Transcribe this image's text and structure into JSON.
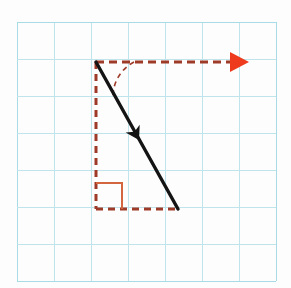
{
  "figure": {
    "caption": "A black vector arrow directed down and to the right, decomposed into dashed vertical and horizontal component legs, with a right-angle marker and an angle arc measured from the horizontal reference direction.",
    "canvas": {
      "width": 291,
      "height": 288,
      "background_color": "#fdfdfd"
    },
    "grid": {
      "name": "graph-paper-grid",
      "line_color": "#bfe4ec",
      "border_color": "#a9dbe6",
      "cell_size": 37,
      "origin_x": 17,
      "origin_y": 22,
      "columns": 7,
      "rows": 7,
      "line_width": 1
    },
    "elements": {
      "vector": {
        "name": "black-vector-arrow",
        "color": "#141414",
        "stroke_width": 3.4,
        "start_x": 96,
        "start_y": 62,
        "end_x": 178,
        "end_y": 209,
        "arrow_position_x": 139,
        "arrow_position_y": 140,
        "arrow_size": 13,
        "label": ""
      },
      "vertical_leg": {
        "name": "vertical-component-dashed-line",
        "color": "#9e3a28",
        "stroke_width": 3,
        "dash": "7,5",
        "x1": 96,
        "y1": 62,
        "x2": 96,
        "y2": 209,
        "label": ""
      },
      "horizontal_leg": {
        "name": "horizontal-component-dashed-line",
        "color": "#9e3a28",
        "stroke_width": 3,
        "dash": "7,5",
        "x1": 96,
        "y1": 209,
        "x2": 178,
        "y2": 209,
        "label": ""
      },
      "reference_line": {
        "name": "horizontal-reference-dashed-line",
        "color": "#9e3a28",
        "stroke_width": 3,
        "dash": "8,5",
        "x1": 96,
        "y1": 62,
        "x2": 232,
        "y2": 62,
        "label": ""
      },
      "reference_arrowhead": {
        "name": "red-arrowhead",
        "color": "#ef3b1d",
        "tip_x": 249,
        "tip_y": 62,
        "back_x": 230,
        "half_height": 10
      },
      "angle_arc": {
        "name": "angle-arc-dashed",
        "color": "#9e3a28",
        "stroke_width": 1.6,
        "dash": "5,4",
        "start_x": 134,
        "start_y": 62,
        "end_x": 113,
        "end_y": 96,
        "radius": 39,
        "label": ""
      },
      "right_angle_marker": {
        "name": "right-angle-marker",
        "color": "#d4663f",
        "stroke_width": 2,
        "corner_x": 96,
        "corner_y": 209,
        "arm_length": 26,
        "label": ""
      }
    }
  }
}
